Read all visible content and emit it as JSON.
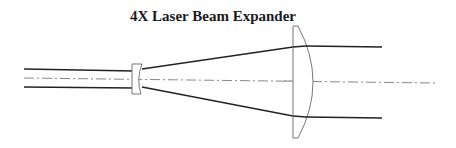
{
  "title": "4X Laser Beam Expander",
  "diagram": {
    "type": "optical-ray-diagram",
    "magnification": "4X",
    "elements": [
      {
        "name": "input-beam",
        "description": "collimated input beam, two parallel rays"
      },
      {
        "name": "negative-lens",
        "description": "small plano-concave diverging lens"
      },
      {
        "name": "diverging-beam",
        "description": "rays spreading between lenses"
      },
      {
        "name": "positive-lens",
        "description": "large plano-convex collimating lens"
      },
      {
        "name": "output-beam",
        "description": "expanded collimated output beam"
      },
      {
        "name": "optical-axis",
        "description": "dash-dot center line"
      }
    ],
    "colors": {
      "ray": "#222222",
      "lens_outline": "#777777",
      "axis": "#888888"
    }
  }
}
